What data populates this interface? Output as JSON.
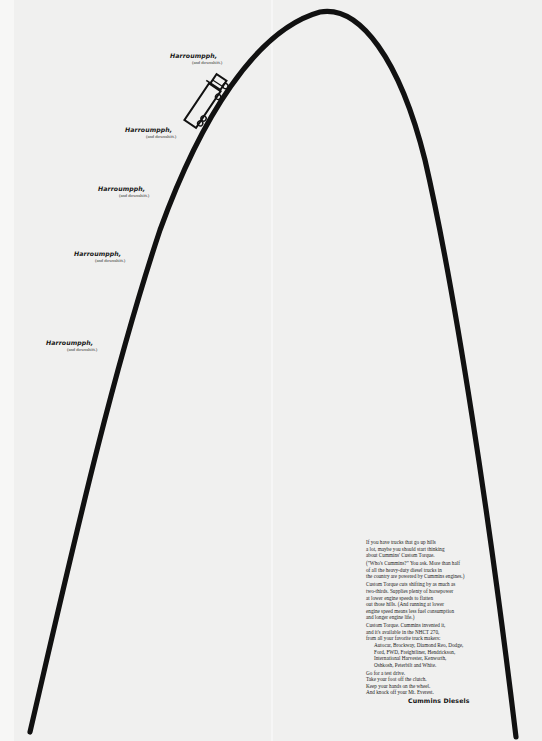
{
  "ad": {
    "brand": "Cummins Diesels",
    "colors": {
      "background": "#f0f0ef",
      "ink": "#111111"
    },
    "labels": [
      {
        "headline": "Harroumpph,",
        "sub": "(and downshift.)"
      },
      {
        "headline": "Harroumpph,",
        "sub": "(and downshift.)"
      },
      {
        "headline": "Harroumpph,",
        "sub": "(and downshift.)"
      },
      {
        "headline": "Harroumpph,",
        "sub": "(and downshift.)"
      },
      {
        "headline": "Harroumpph,",
        "sub": "(and downshift.)"
      }
    ],
    "illustration": {
      "mountain": "parabolic-hill-line",
      "vehicle": "truck-icon"
    },
    "copy": {
      "p1": [
        "If you have trucks that go up hills",
        "a lot, maybe you should start thinking",
        "about Cummins' Custom Torque."
      ],
      "p2": [
        "(\"Who's Cummins?\" You ask. More than half",
        "of all the heavy-duty diesel trucks in",
        "the country are powered by Cummins engines.)"
      ],
      "p3": [
        "Custom Torque cuts shifting by as much as",
        "two-thirds. Supplies plenty of horsepower",
        "at lower engine speeds to flatten",
        "out those hills. (And running at lower",
        "engine speed means less fuel consumption",
        "and longer engine life.)"
      ],
      "p4": [
        "Custom Torque. Cummins invented it,",
        "and it's available in the NHCT 270,",
        "from all your favorite truck makers:"
      ],
      "makers": [
        "Autocar, Brockway, Diamond Reo, Dodge,",
        "Ford, FWD, Freightliner, Hendrickson,",
        "International Harvester, Kenworth,",
        "Oshkosh, Peterbilt and White."
      ],
      "p5": [
        "Go for a test drive.",
        "Take your foot off the clutch.",
        "Keep your hands on the wheel.",
        "And knock off your Mt. Everest."
      ],
      "signature": "Cummins Diesels"
    }
  }
}
